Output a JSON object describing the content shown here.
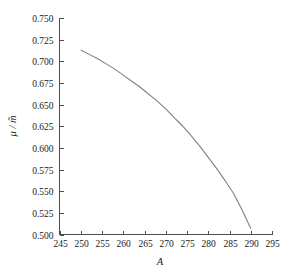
{
  "chart_data": {
    "type": "line",
    "title": "",
    "xlabel": "A",
    "ylabel": "μ / m̃",
    "xlim": [
      245,
      295
    ],
    "ylim": [
      0.5,
      0.75
    ],
    "grid": false,
    "legend": null,
    "xticks": [
      245,
      250,
      255,
      260,
      265,
      270,
      275,
      280,
      285,
      290,
      295
    ],
    "xtick_labels": [
      "245",
      "250",
      "255",
      "260",
      "265",
      "270",
      "275",
      "280",
      "285",
      "290",
      "295"
    ],
    "yticks": [
      0.5,
      0.525,
      0.55,
      0.575,
      0.6,
      0.625,
      0.65,
      0.675,
      0.7,
      0.725,
      0.75
    ],
    "ytick_labels": [
      "0.500",
      "0.525",
      "0.550",
      "0.575",
      "0.600",
      "0.625",
      "0.650",
      "0.675",
      "0.700",
      "0.725",
      "0.750"
    ],
    "series": [
      {
        "name": "mu-over-m-tilde",
        "color": "#808080",
        "x": [
          250,
          252,
          254,
          256,
          258,
          260,
          262,
          264,
          266,
          268,
          270,
          272,
          274,
          276,
          278,
          280,
          282,
          284,
          286,
          288,
          290
        ],
        "y": [
          0.713,
          0.708,
          0.703,
          0.697,
          0.691,
          0.684,
          0.677,
          0.67,
          0.662,
          0.654,
          0.645,
          0.635,
          0.625,
          0.614,
          0.602,
          0.589,
          0.576,
          0.562,
          0.547,
          0.528,
          0.507
        ]
      }
    ]
  },
  "colors": {
    "curve": "#808080",
    "axis": "#4d4d4d",
    "text": "#1a1a1a",
    "background": "#ffffff"
  }
}
